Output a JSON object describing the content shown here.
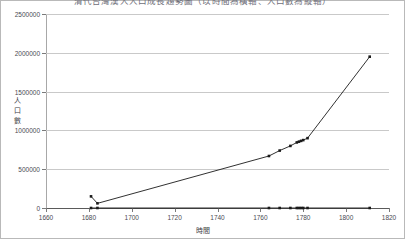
{
  "chart_data": {
    "type": "line",
    "title": "清代台灣漢人人口成長趨勢圖（以時間為橫軸、人口數為縱軸）",
    "xlabel": "時間",
    "ylabel": "人口數",
    "ylabel_chars": [
      "人",
      "口",
      "數"
    ],
    "xlim": [
      1660,
      1820
    ],
    "ylim": [
      0,
      2500000
    ],
    "xticks": [
      1660,
      1680,
      1700,
      1720,
      1740,
      1760,
      1780,
      1800,
      1820
    ],
    "yticks": [
      0,
      500000,
      1000000,
      1500000,
      2000000,
      2500000
    ],
    "ytick_labels": [
      "0",
      "500000",
      "1000000",
      "1500000",
      "2000000",
      "2500000"
    ],
    "xtick_labels": [
      "1660",
      "1680",
      "1700",
      "1720",
      "1740",
      "1760",
      "1780",
      "1800",
      "1820"
    ],
    "grid": true,
    "grid_axis": "y",
    "legend": false,
    "legend_position": "none",
    "marker": "square",
    "series": [
      {
        "name": "人口數",
        "color": "#1a1a1a",
        "line": true,
        "points": [
          {
            "x": 1681,
            "y": 150000
          },
          {
            "x": 1684,
            "y": 60000
          },
          {
            "x": 1764,
            "y": 670000
          },
          {
            "x": 1769,
            "y": 740000
          },
          {
            "x": 1774,
            "y": 800000
          },
          {
            "x": 1777,
            "y": 845000
          },
          {
            "x": 1778,
            "y": 855000
          },
          {
            "x": 1779,
            "y": 865000
          },
          {
            "x": 1780,
            "y": 875000
          },
          {
            "x": 1782,
            "y": 900000
          },
          {
            "x": 1811,
            "y": 1950000
          }
        ]
      },
      {
        "name": "基準線",
        "color": "#1a1a1a",
        "line": true,
        "points": [
          {
            "x": 1681,
            "y": 0
          },
          {
            "x": 1684,
            "y": 0
          },
          {
            "x": 1764,
            "y": 0
          },
          {
            "x": 1769,
            "y": 0
          },
          {
            "x": 1774,
            "y": 0
          },
          {
            "x": 1777,
            "y": 0
          },
          {
            "x": 1778,
            "y": 0
          },
          {
            "x": 1779,
            "y": 0
          },
          {
            "x": 1780,
            "y": 0
          },
          {
            "x": 1782,
            "y": 0
          },
          {
            "x": 1811,
            "y": 0
          }
        ]
      }
    ]
  }
}
